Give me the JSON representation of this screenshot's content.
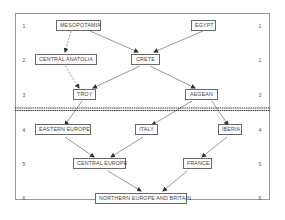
{
  "diagram": {
    "row_numbers": [
      "1",
      "2",
      "3",
      "4",
      "5",
      "6"
    ],
    "nodes": {
      "mesopotamia": "MESOPOTAMIA",
      "egypt": "EGYPT",
      "central_anatolia": "CENTRAL ANATOLIA",
      "crete": "CRETE",
      "troy": "TROY",
      "aegean": "AEGEAN",
      "eastern_europe": "EASTERN EUROPE",
      "italy": "ITALY",
      "iberia": "IBERIA",
      "central_europe": "CENTRAL EUROPE",
      "france": "FRANCE",
      "northern_europe_britain": "NORTHERN EUROPE AND BRITAIN"
    },
    "edges": [
      {
        "from": "MESOPOTAMIA",
        "to": "CENTRAL ANATOLIA",
        "style": "dashed"
      },
      {
        "from": "MESOPOTAMIA",
        "to": "CRETE",
        "style": "solid"
      },
      {
        "from": "EGYPT",
        "to": "CRETE",
        "style": "solid"
      },
      {
        "from": "CENTRAL ANATOLIA",
        "to": "TROY",
        "style": "dashed"
      },
      {
        "from": "CRETE",
        "to": "TROY",
        "style": "solid"
      },
      {
        "from": "CRETE",
        "to": "AEGEAN",
        "style": "solid"
      },
      {
        "from": "TROY",
        "to": "EASTERN EUROPE",
        "style": "solid"
      },
      {
        "from": "AEGEAN",
        "to": "ITALY",
        "style": "solid"
      },
      {
        "from": "AEGEAN",
        "to": "IBERIA",
        "style": "solid"
      },
      {
        "from": "EASTERN EUROPE",
        "to": "CENTRAL EUROPE",
        "style": "solid"
      },
      {
        "from": "ITALY",
        "to": "CENTRAL EUROPE",
        "style": "solid"
      },
      {
        "from": "IBERIA",
        "to": "FRANCE",
        "style": "solid"
      },
      {
        "from": "CENTRAL EUROPE",
        "to": "NORTHERN EUROPE AND BRITAIN",
        "style": "solid"
      },
      {
        "from": "FRANCE",
        "to": "NORTHERN EUROPE AND BRITAIN",
        "style": "solid"
      }
    ],
    "separator": "double dashed line between rows 3 and 4"
  }
}
